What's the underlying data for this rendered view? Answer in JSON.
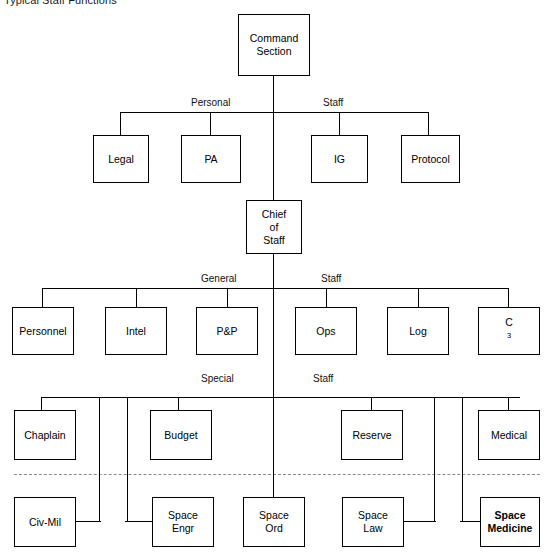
{
  "title": "Typical Staff Functions",
  "root": {
    "label": "Command\nSection",
    "lines": [
      "Command",
      "Section"
    ]
  },
  "chief": {
    "label": "Chief of Staff",
    "lines": [
      "Chief",
      "of",
      "Staff"
    ]
  },
  "bus_labels": {
    "personal_staff": {
      "left": "Personal",
      "right": "Staff"
    },
    "general_staff": {
      "left": "General",
      "right": "Staff"
    },
    "special_staff": {
      "left": "Special",
      "right": "Staff"
    }
  },
  "rows": {
    "personal_staff": [
      {
        "id": "legal",
        "label": "Legal"
      },
      {
        "id": "pa",
        "label": "PA"
      },
      {
        "id": "ig",
        "label": "IG"
      },
      {
        "id": "protocol",
        "label": "Protocol"
      }
    ],
    "general_staff": [
      {
        "id": "personnel",
        "label": "Personnel"
      },
      {
        "id": "intel",
        "label": "Intel"
      },
      {
        "id": "pandp",
        "label": "P&P"
      },
      {
        "id": "ops",
        "label": "Ops"
      },
      {
        "id": "log",
        "label": "Log"
      },
      {
        "id": "c3",
        "label": "C3",
        "superscript": "3",
        "base": "C"
      }
    ],
    "special_staff": [
      {
        "id": "chaplain",
        "label": "Chaplain"
      },
      {
        "id": "budget",
        "label": "Budget"
      },
      {
        "id": "reserve",
        "label": "Reserve"
      },
      {
        "id": "medical",
        "label": "Medical"
      }
    ],
    "special_staff_lower": [
      {
        "id": "civ-mil",
        "label": "Civ-Mil",
        "lines": [
          "Civ-Mil"
        ],
        "bold": false
      },
      {
        "id": "space-engr",
        "label": "Space Engr",
        "lines": [
          "Space",
          "Engr"
        ],
        "bold": false
      },
      {
        "id": "space-ord",
        "label": "Space Ord",
        "lines": [
          "Space",
          "Ord"
        ],
        "bold": false
      },
      {
        "id": "space-law",
        "label": "Space Law",
        "lines": [
          "Space",
          "Law"
        ],
        "bold": false
      },
      {
        "id": "space-medicine",
        "label": "Space Medicine",
        "lines": [
          "Space",
          "Medicine"
        ],
        "bold": true
      }
    ]
  },
  "divider": {
    "style": "dashed",
    "color": "#8a8a8a"
  },
  "colors": {
    "line": "#000000",
    "background": "#ffffff",
    "divider": "#8a8a8a"
  }
}
